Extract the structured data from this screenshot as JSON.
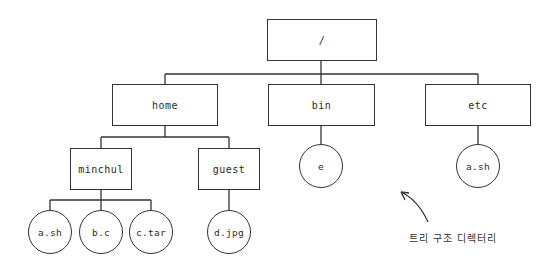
{
  "diagram": {
    "type": "directory-tree",
    "root": {
      "label": "/"
    },
    "level1": [
      {
        "label": "home"
      },
      {
        "label": "bin"
      },
      {
        "label": "etc"
      }
    ],
    "home_children": [
      {
        "label": "minchul"
      },
      {
        "label": "guest"
      }
    ],
    "minchul_files": [
      {
        "label": "a.sh"
      },
      {
        "label": "b.c"
      },
      {
        "label": "c.tar"
      }
    ],
    "guest_files": [
      {
        "label": "d.jpg"
      }
    ],
    "bin_files": [
      {
        "label": "e"
      }
    ],
    "etc_files": [
      {
        "label": "a.sh"
      }
    ],
    "annotation": {
      "label": "트리 구조 디렉터리"
    },
    "colors": {
      "stroke": "#333333",
      "background": "#ffffff",
      "text": "#2b2b2b"
    }
  }
}
